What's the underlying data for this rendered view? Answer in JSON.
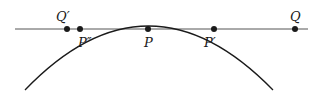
{
  "diagram": {
    "colors": {
      "ink": "#1a1a1a",
      "line": "#555555",
      "background": "#ffffff"
    },
    "line": {
      "x1": 15,
      "y1": 29,
      "x2": 308,
      "y2": 29
    },
    "arc": {
      "path": "M 25 90 Q 148 -38 273 90"
    },
    "points": [
      {
        "id": "Q-prime",
        "label": "Q′",
        "x": 67,
        "y": 29,
        "lx": 56,
        "ly": 21
      },
      {
        "id": "P-double-prime",
        "label": "P″",
        "x": 80,
        "y": 29,
        "lx": 78,
        "ly": 47
      },
      {
        "id": "P",
        "label": "P",
        "x": 148,
        "y": 29,
        "lx": 144,
        "ly": 47
      },
      {
        "id": "P-prime",
        "label": "P′",
        "x": 214,
        "y": 29,
        "lx": 204,
        "ly": 47
      },
      {
        "id": "Q",
        "label": "Q",
        "x": 295,
        "y": 29,
        "lx": 290,
        "ly": 21
      }
    ]
  }
}
